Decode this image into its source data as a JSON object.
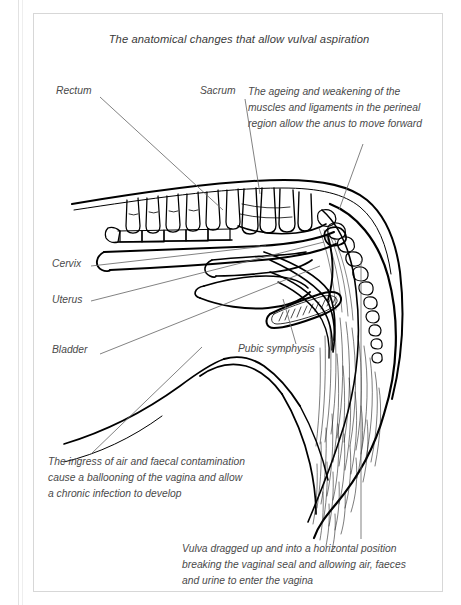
{
  "figure": {
    "title": "The anatomical changes that allow vulval aspiration",
    "background_color": "#ffffff",
    "frame_color": "#d7d7d7",
    "ink_color": "#000000",
    "text_color": "#4a4a4a",
    "leader_color": "#6b6b6b"
  },
  "labels": [
    {
      "id": "rectum",
      "text": "Rectum",
      "x": 22,
      "y": 79
    },
    {
      "id": "sacrum",
      "text": "Sacrum",
      "x": 166,
      "y": 79
    },
    {
      "id": "cervix",
      "text": "Cervix",
      "x": 18,
      "y": 252
    },
    {
      "id": "uterus",
      "text": "Uterus",
      "x": 18,
      "y": 288
    },
    {
      "id": "bladder",
      "text": "Bladder",
      "x": 18,
      "y": 338
    },
    {
      "id": "pubic-symphysis",
      "text": "Pubic symphysis",
      "x": 238,
      "y": 337
    }
  ],
  "annotations": [
    {
      "id": "anus-forward",
      "x": 247,
      "y": 78,
      "width": 190,
      "lines": [
        "The ageing and weakening of the",
        "muscles and ligaments in the perineal",
        "region allow the anus to move forward"
      ]
    },
    {
      "id": "vaginal-ballooning",
      "x": 18,
      "y": 447,
      "width": 230,
      "lines": [
        "The ingress of air and faecal contamination",
        "cause a ballooning of the vagina and allow",
        "a chronic infection to develop"
      ]
    },
    {
      "id": "vulva-dragged",
      "x": 182,
      "y": 534,
      "width": 250,
      "lines": [
        "Vulva dragged up and into a horizontal position",
        "breaking the vaginal seal and allowing air, faeces",
        "and urine to enter the vagina"
      ]
    }
  ],
  "leader_lines": [
    {
      "id": "leader-rectum",
      "x1": 66,
      "y1": 83,
      "x2": 189,
      "y2": 196
    },
    {
      "id": "leader-sacrum",
      "x1": 211,
      "y1": 85,
      "x2": 226,
      "y2": 180
    },
    {
      "id": "leader-anus-forward",
      "x1": 329,
      "y1": 130,
      "x2": 305,
      "y2": 196
    },
    {
      "id": "leader-cervix",
      "x1": 57,
      "y1": 252,
      "x2": 232,
      "y2": 232
    },
    {
      "id": "leader-uterus",
      "x1": 57,
      "y1": 287,
      "x2": 290,
      "y2": 228
    },
    {
      "id": "leader-bladder",
      "x1": 66,
      "y1": 340,
      "x2": 286,
      "y2": 252
    },
    {
      "id": "leader-pubic-symphysis",
      "x1": 262,
      "y1": 330,
      "x2": 249,
      "y2": 285
    },
    {
      "id": "leader-ballooning",
      "x1": 57,
      "y1": 440,
      "x2": 168,
      "y2": 333
    },
    {
      "id": "leader-vulva",
      "x1": 327,
      "y1": 525,
      "x2": 327,
      "y2": 247
    }
  ],
  "anatomy_parts": [
    "lumbar-vertebrae",
    "sacrum",
    "caudal-vertebrae-tail",
    "rectum",
    "anus",
    "cervix",
    "uterus",
    "bladder",
    "vagina",
    "vulva",
    "pubic-symphysis",
    "tail-hair",
    "perineal-region",
    "abdominal-wall"
  ]
}
